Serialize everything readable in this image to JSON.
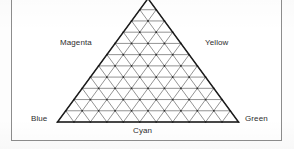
{
  "figure": {
    "kind": "triangular-color-gamut-diagram",
    "frame_color": "#8d8d8d",
    "background_color": "#ffffff",
    "line_color": "#3a3a3a",
    "outline_color": "#1f1f1f",
    "apex_clipped": true
  },
  "labels": {
    "magenta": "Magenta",
    "yellow": "Yellow",
    "blue": "Blue",
    "green": "Green",
    "cyan": "Cyan"
  },
  "chart_data": {
    "type": "scatter",
    "title": "",
    "xlabel": "",
    "ylabel": "",
    "grid": true,
    "legend_position": "none",
    "subdivisions": 11,
    "vertices": [
      {
        "name": "Blue",
        "x": 0.0,
        "y": 0.0,
        "label_position": "bottom-left"
      },
      {
        "name": "Green",
        "x": 1.0,
        "y": 0.0,
        "label_position": "bottom-right"
      },
      {
        "name": "apex",
        "x": 0.5,
        "y": 1.0,
        "label_position": "top-clipped"
      }
    ],
    "edge_labels": [
      {
        "name": "Magenta",
        "edge": "left",
        "position": 0.5
      },
      {
        "name": "Yellow",
        "edge": "right",
        "position": 0.5
      },
      {
        "name": "Cyan",
        "edge": "bottom",
        "position": 0.5
      }
    ],
    "categories": [
      "Blue",
      "Cyan",
      "Green",
      "Yellow",
      "Magenta"
    ],
    "values": [
      0,
      0,
      0,
      0,
      0
    ]
  }
}
